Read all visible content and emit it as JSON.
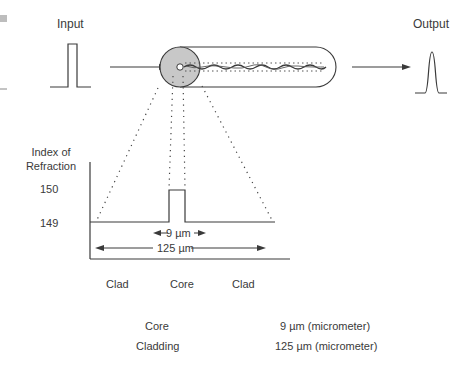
{
  "diagram": {
    "input_label": "Input",
    "output_label": "Output",
    "axis_label_line1": "Index of",
    "axis_label_line2": "Refraction",
    "tick_high": "150",
    "tick_low": "149",
    "core_width_label": "9 µm",
    "cladding_width_label": "125 µm",
    "regions": [
      "Clad",
      "Core",
      "Clad"
    ]
  },
  "legend": [
    {
      "name": "Core",
      "value": "9 µm (micrometer)"
    },
    {
      "name": "Cladding",
      "value": "125 µm (micrometer)"
    }
  ],
  "colors": {
    "line": "#3a3a3a",
    "core_disc": "#c8c8c8"
  }
}
